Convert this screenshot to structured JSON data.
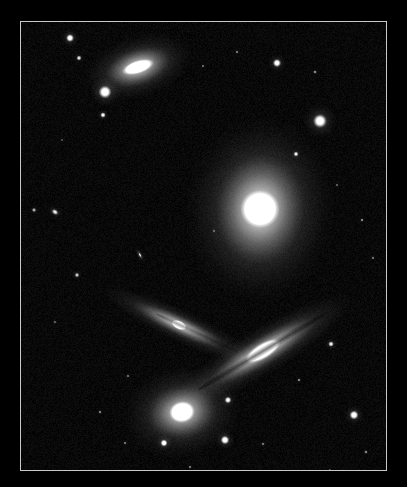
{
  "viewer": {
    "width": 407,
    "height": 487,
    "background_color": "#000000",
    "border_color": "#c9c9c9",
    "border_width_px": 1,
    "field": {
      "left": 21,
      "top": 22,
      "width": 365,
      "height": 448
    },
    "image_type": "astronomical-grayscale-photograph",
    "subject": "compact galaxy group"
  },
  "sky": {
    "background_color": "#010101",
    "galaxies": [
      {
        "id": "galaxy-top-lenticular",
        "name": "top-left-lenticular-galaxy",
        "cx": 117,
        "cy": 45,
        "core_w": 34,
        "core_h": 13,
        "halo_w": 112,
        "halo_h": 62,
        "angle_deg": -18,
        "core_color": "#ffffff",
        "halo_color": "#b9b9b9"
      },
      {
        "id": "galaxy-central-elliptical",
        "name": "central-elliptical-galaxy",
        "cx": 239,
        "cy": 187,
        "core_w": 40,
        "core_h": 38,
        "halo_w": 150,
        "halo_h": 186,
        "angle_deg": 4,
        "core_color": "#ffffff",
        "halo_color": "#c4c4c4"
      },
      {
        "id": "galaxy-x-left-spiral",
        "name": "left-edge-on-spiral-galaxy",
        "cx": 158,
        "cy": 303,
        "core_w": 16,
        "core_h": 9,
        "halo_w": 168,
        "halo_h": 33,
        "angle_deg": 25,
        "core_color": "#ffffff",
        "halo_color": "#a8a8a8"
      },
      {
        "id": "galaxy-x-right-spiral",
        "name": "right-edge-on-spiral-galaxy",
        "cx": 242,
        "cy": 329,
        "core_w": 40,
        "core_h": 16,
        "halo_w": 210,
        "halo_h": 48,
        "angle_deg": -31,
        "core_color": "#ffffff",
        "halo_color": "#bdbdbd"
      },
      {
        "id": "galaxy-bottom-spiral",
        "name": "bottom-barred-spiral-galaxy",
        "cx": 161,
        "cy": 390,
        "core_w": 26,
        "core_h": 22,
        "halo_w": 118,
        "halo_h": 92,
        "angle_deg": -10,
        "core_color": "#ffffff",
        "halo_color": "#b0b0b0"
      },
      {
        "id": "galaxy-small-edge-on",
        "name": "small-faint-edge-on-galaxy",
        "cx": 119,
        "cy": 233,
        "core_w": 5,
        "core_h": 2,
        "halo_w": 18,
        "halo_h": 7,
        "angle_deg": 62,
        "core_color": "#8d8d8d",
        "halo_color": "#555555"
      },
      {
        "id": "galaxy-faint-left-fuzzy",
        "name": "faint-left-fuzzy-galaxy",
        "cx": 34,
        "cy": 190,
        "core_w": 7,
        "core_h": 5,
        "halo_w": 17,
        "halo_h": 12,
        "angle_deg": 35,
        "core_color": "#9a9a9a",
        "halo_color": "#4a4a4a"
      }
    ],
    "stars": [
      {
        "name": "star-bright-upper-left",
        "cx": 84,
        "cy": 70,
        "r": 6.5,
        "brightness": 1.0,
        "halo_r": 15
      },
      {
        "name": "star-bright-right-of-elliptical",
        "cx": 299,
        "cy": 99,
        "r": 7.0,
        "brightness": 1.0,
        "halo_r": 17
      },
      {
        "name": "star-bottom-right-field",
        "cx": 333,
        "cy": 393,
        "r": 4.6,
        "brightness": 0.95,
        "halo_r": 10
      },
      {
        "name": "star-below-bottom-galaxy",
        "cx": 204,
        "cy": 418,
        "r": 4.4,
        "brightness": 0.95,
        "halo_r": 10
      },
      {
        "name": "star-lower-left-of-bottom-galaxy",
        "cx": 143,
        "cy": 421,
        "r": 3.6,
        "brightness": 0.9,
        "halo_r": 8
      },
      {
        "name": "star-above-top-galaxy",
        "cx": 49,
        "cy": 16,
        "r": 4.0,
        "brightness": 0.92,
        "halo_r": 9
      },
      {
        "name": "star-top-mid-field",
        "cx": 256,
        "cy": 41,
        "r": 4.2,
        "brightness": 0.9,
        "halo_r": 9
      },
      {
        "name": "star-right-of-bottom-galaxy",
        "cx": 207,
        "cy": 378,
        "r": 3.4,
        "brightness": 0.82,
        "halo_r": 7
      },
      {
        "name": "star-left-of-top-galaxy",
        "cx": 58,
        "cy": 36,
        "r": 2.6,
        "brightness": 0.72,
        "halo_r": 5
      },
      {
        "name": "star-below-bright-upper-left",
        "cx": 82,
        "cy": 93,
        "r": 2.8,
        "brightness": 0.78,
        "halo_r": 6
      },
      {
        "name": "star-near-elliptical-halo",
        "cx": 275,
        "cy": 132,
        "r": 2.6,
        "brightness": 0.72,
        "halo_r": 5
      },
      {
        "name": "star-right-of-x-cross",
        "cx": 310,
        "cy": 322,
        "r": 2.8,
        "brightness": 0.75,
        "halo_r": 6
      },
      {
        "name": "star-mid-left-field",
        "cx": 56,
        "cy": 253,
        "r": 2.4,
        "brightness": 0.62,
        "halo_r": 5
      },
      {
        "name": "star-left-edge-faint",
        "cx": 13,
        "cy": 188,
        "r": 2.2,
        "brightness": 0.55,
        "halo_r": 4
      },
      {
        "name": "star-upper-right-faint",
        "cx": 294,
        "cy": 50,
        "r": 1.8,
        "brightness": 0.48,
        "halo_r": 3
      },
      {
        "name": "star-top-faint-a",
        "cx": 216,
        "cy": 30,
        "r": 1.6,
        "brightness": 0.42,
        "halo_r": 3
      },
      {
        "name": "star-top-faint-b",
        "cx": 182,
        "cy": 44,
        "r": 1.5,
        "brightness": 0.38,
        "halo_r": 3
      },
      {
        "name": "star-mid-right-faint",
        "cx": 341,
        "cy": 198,
        "r": 1.7,
        "brightness": 0.45,
        "halo_r": 3
      },
      {
        "name": "star-right-field-faint",
        "cx": 352,
        "cy": 236,
        "r": 1.5,
        "brightness": 0.4,
        "halo_r": 3
      },
      {
        "name": "star-lower-right-faint-a",
        "cx": 278,
        "cy": 358,
        "r": 1.7,
        "brightness": 0.45,
        "halo_r": 3
      },
      {
        "name": "star-lower-right-faint-b",
        "cx": 242,
        "cy": 422,
        "r": 1.6,
        "brightness": 0.42,
        "halo_r": 3
      },
      {
        "name": "star-lower-right-faint-c",
        "cx": 345,
        "cy": 430,
        "r": 1.8,
        "brightness": 0.46,
        "halo_r": 3
      },
      {
        "name": "star-bottom-left-faint-a",
        "cx": 79,
        "cy": 390,
        "r": 1.7,
        "brightness": 0.44,
        "halo_r": 3
      },
      {
        "name": "star-bottom-left-faint-b",
        "cx": 104,
        "cy": 421,
        "r": 1.6,
        "brightness": 0.4,
        "halo_r": 3
      },
      {
        "name": "star-bottom-left-faint-c",
        "cx": 107,
        "cy": 354,
        "r": 1.5,
        "brightness": 0.38,
        "halo_r": 3
      },
      {
        "name": "star-bottom-centre-faint",
        "cx": 169,
        "cy": 445,
        "r": 1.6,
        "brightness": 0.42,
        "halo_r": 3
      },
      {
        "name": "star-left-faint-low",
        "cx": 34,
        "cy": 300,
        "r": 1.4,
        "brightness": 0.34,
        "halo_r": 3
      },
      {
        "name": "star-centre-faint",
        "cx": 193,
        "cy": 209,
        "r": 1.4,
        "brightness": 0.32,
        "halo_r": 3
      },
      {
        "name": "star-right-upper-faint",
        "cx": 316,
        "cy": 163,
        "r": 1.4,
        "brightness": 0.34,
        "halo_r": 3
      },
      {
        "name": "star-bottom-right-corner-faint",
        "cx": 309,
        "cy": 448,
        "r": 1.3,
        "brightness": 0.3,
        "halo_r": 2
      },
      {
        "name": "star-top-left-corner-faint",
        "cx": 41,
        "cy": 118,
        "r": 1.3,
        "brightness": 0.3,
        "halo_r": 2
      }
    ],
    "dust_lanes": [
      {
        "name": "dust-lane-right-edge-on-spiral",
        "cx": 242,
        "cy": 329,
        "w": 150,
        "h": 4,
        "angle_deg": -31,
        "color": "rgba(0,0,0,0.55)"
      },
      {
        "name": "dust-lane-left-edge-on-spiral",
        "cx": 176,
        "cy": 311,
        "w": 90,
        "h": 3,
        "angle_deg": 25,
        "color": "rgba(0,0,0,0.35)"
      }
    ]
  }
}
